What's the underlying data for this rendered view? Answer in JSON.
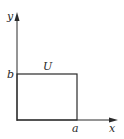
{
  "diagram": {
    "type": "coordinate-region",
    "axes": {
      "x_label": "x",
      "y_label": "y"
    },
    "region": {
      "label": "U",
      "shape": "rectangle",
      "corner_labels": {
        "x_extent": "a",
        "y_extent": "b"
      }
    },
    "colors": {
      "stroke": "#2a2a2a",
      "background": "#ffffff"
    }
  }
}
